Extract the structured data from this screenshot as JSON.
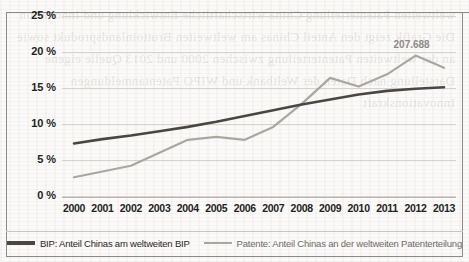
{
  "page": {
    "title_fragment": "",
    "bleed_text": "weltweiten Patenterteilung China wirtschaftliche Entwicklung und Innovation Die Grafik zeigt den Anteil Chinas am weltweiten Bruttoinlandsprodukt sowie an der weltweiten Patenterteilung zwischen 2000 und 2013 Quelle eigene Darstellung nach Daten der Weltbank und WIPO Patentanmeldungen Innovationskraft"
  },
  "chart_data": {
    "type": "line",
    "title": "",
    "xlabel": "",
    "ylabel": "",
    "x": [
      2000,
      2001,
      2002,
      2003,
      2004,
      2005,
      2006,
      2007,
      2008,
      2009,
      2010,
      2011,
      2012,
      2013
    ],
    "categories": [
      "2000",
      "2001",
      "2002",
      "2003",
      "2004",
      "2005",
      "2006",
      "2007",
      "2008",
      "2009",
      "2010",
      "2011",
      "2012",
      "2013"
    ],
    "ylim": [
      0,
      25
    ],
    "yticks": [
      0,
      5,
      10,
      15,
      20,
      25
    ],
    "ytick_labels": [
      "0 %",
      "5 %",
      "10 %",
      "15 %",
      "20 %",
      "25 %"
    ],
    "grid": true,
    "legend_position": "bottom",
    "series": [
      {
        "name": "BIP: Anteil Chinas am weltweiten BIP",
        "color": "#4a4743",
        "width": 2.6,
        "values": [
          7.3,
          7.9,
          8.4,
          9.0,
          9.6,
          10.3,
          11.1,
          11.9,
          12.7,
          13.4,
          14.1,
          14.6,
          14.9,
          15.1
        ]
      },
      {
        "name": "Patente: Anteil Chinas an der weltweiten Patenterteilung",
        "color": "#aaa7a3",
        "width": 2.2,
        "values": [
          2.6,
          3.4,
          4.2,
          6.0,
          7.8,
          8.2,
          7.8,
          9.6,
          12.8,
          16.4,
          15.2,
          16.9,
          19.5,
          17.8
        ]
      }
    ],
    "annotations": [
      {
        "text": "207.688",
        "x": 2012,
        "y": 19.5,
        "color": "#8c8985"
      }
    ]
  },
  "legend": {
    "items": [
      {
        "label": "BIP: Anteil Chinas am weltweiten BIP",
        "color": "#4a4743"
      },
      {
        "label": "Patente: Anteil Chinas an der weltweiten Patenterteilung",
        "color": "#aaa7a3"
      }
    ]
  }
}
